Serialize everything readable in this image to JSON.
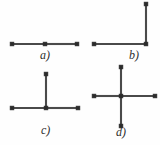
{
  "figure": {
    "caption_style": "lettered",
    "panel_count": 4,
    "stroke_color": "#4a4a4a",
    "vertex_color": "#2b2b2b",
    "background_color": "#fefefe"
  },
  "panels": [
    {
      "id": "a",
      "label": "a)",
      "shape_name": "path-3-horizontal",
      "vertex_count": 3,
      "edge_count": 2,
      "label_x": 40,
      "label_y": 49,
      "origin_x": 6,
      "origin_y": 36,
      "width": 78,
      "height": 18,
      "vertices": [
        {
          "x": 6,
          "y": 8
        },
        {
          "x": 39,
          "y": 8
        },
        {
          "x": 71,
          "y": 8
        }
      ],
      "edges": [
        {
          "x1": 6,
          "y1": 8,
          "x2": 39,
          "y2": 8
        },
        {
          "x1": 39,
          "y1": 8,
          "x2": 71,
          "y2": 8
        }
      ]
    },
    {
      "id": "b",
      "label": "b)",
      "shape_name": "path-3-elbow",
      "vertex_count": 3,
      "edge_count": 2,
      "label_x": 129,
      "label_y": 49,
      "origin_x": 88,
      "origin_y": -2,
      "width": 68,
      "height": 54,
      "vertices": [
        {
          "x": 6,
          "y": 46
        },
        {
          "x": 58,
          "y": 46
        },
        {
          "x": 58,
          "y": 6
        }
      ],
      "edges": [
        {
          "x1": 6,
          "y1": 46,
          "x2": 58,
          "y2": 46
        },
        {
          "x1": 58,
          "y1": 46,
          "x2": 58,
          "y2": 6
        }
      ]
    },
    {
      "id": "c",
      "label": "c)",
      "shape_name": "star-4-tee",
      "vertex_count": 4,
      "edge_count": 3,
      "label_x": 41,
      "label_y": 124,
      "origin_x": 6,
      "origin_y": 68,
      "width": 78,
      "height": 48,
      "vertices": [
        {
          "x": 6,
          "y": 40
        },
        {
          "x": 40,
          "y": 40
        },
        {
          "x": 72,
          "y": 40
        },
        {
          "x": 40,
          "y": 6
        }
      ],
      "edges": [
        {
          "x1": 6,
          "y1": 40,
          "x2": 40,
          "y2": 40
        },
        {
          "x1": 40,
          "y1": 40,
          "x2": 72,
          "y2": 40
        },
        {
          "x1": 40,
          "y1": 40,
          "x2": 40,
          "y2": 6
        }
      ]
    },
    {
      "id": "d",
      "label": "d)",
      "shape_name": "star-5-cross",
      "vertex_count": 5,
      "edge_count": 4,
      "label_x": 116,
      "label_y": 126,
      "origin_x": 88,
      "origin_y": 61,
      "width": 72,
      "height": 72,
      "vertices": [
        {
          "x": 6,
          "y": 35
        },
        {
          "x": 33,
          "y": 35
        },
        {
          "x": 67,
          "y": 35
        },
        {
          "x": 33,
          "y": 6
        },
        {
          "x": 33,
          "y": 65
        }
      ],
      "edges": [
        {
          "x1": 6,
          "y1": 35,
          "x2": 33,
          "y2": 35
        },
        {
          "x1": 33,
          "y1": 35,
          "x2": 67,
          "y2": 35
        },
        {
          "x1": 33,
          "y1": 6,
          "x2": 33,
          "y2": 35
        },
        {
          "x1": 33,
          "y1": 35,
          "x2": 33,
          "y2": 65
        }
      ]
    }
  ]
}
